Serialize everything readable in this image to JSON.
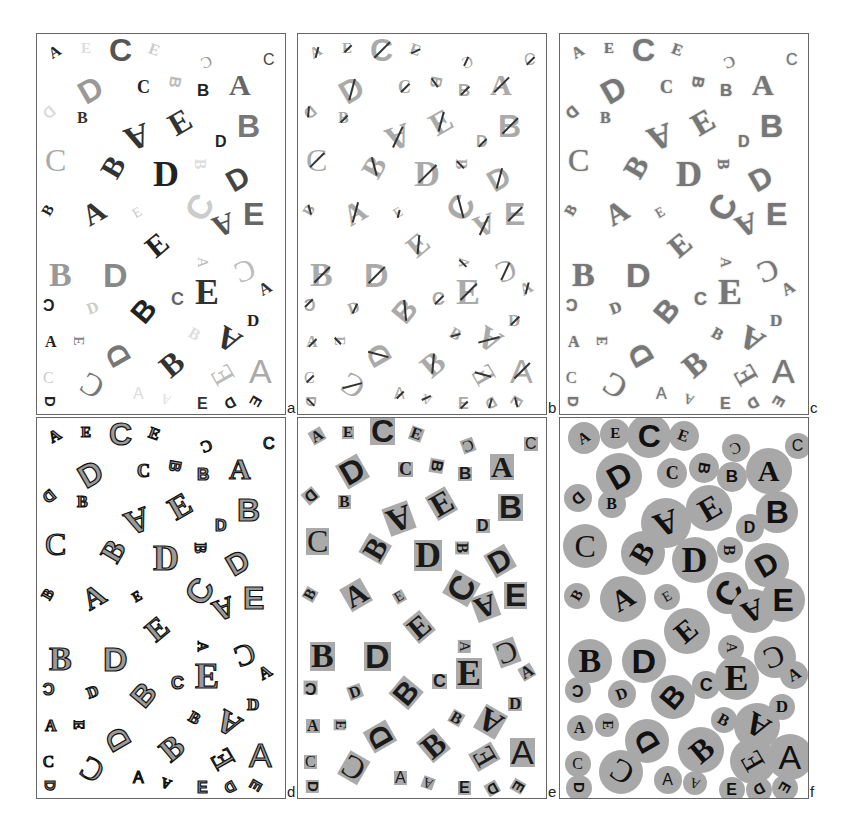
{
  "figure": {
    "panels": [
      {
        "id": "a",
        "label": "a",
        "style": "grayscale-mixed",
        "x": 36,
        "y": 33,
        "w": 250,
        "h": 382
      },
      {
        "id": "b",
        "label": "b",
        "style": "slashed-light",
        "x": 297,
        "y": 33,
        "w": 250,
        "h": 382
      },
      {
        "id": "c",
        "label": "c",
        "style": "outlined-blur",
        "x": 559,
        "y": 33,
        "w": 250,
        "h": 382
      },
      {
        "id": "d",
        "label": "d",
        "style": "filled-dark",
        "x": 36,
        "y": 417,
        "w": 250,
        "h": 382
      },
      {
        "id": "e",
        "label": "e",
        "style": "boxed-background",
        "x": 297,
        "y": 417,
        "w": 250,
        "h": 382
      },
      {
        "id": "f",
        "label": "f",
        "style": "circle-background",
        "x": 559,
        "y": 417,
        "w": 250,
        "h": 382
      }
    ],
    "letters": [
      {
        "c": "A",
        "x": 12,
        "y": 10,
        "s": 16,
        "r": -30,
        "f": "serif",
        "w": "bold",
        "g": "#222",
        "d": 32
      },
      {
        "c": "E",
        "x": 44,
        "y": 6,
        "s": 15,
        "r": 0,
        "f": "serif",
        "w": "bold",
        "g": "#ddd",
        "d": 30
      },
      {
        "c": "C",
        "x": 72,
        "y": 0,
        "s": 32,
        "r": 0,
        "f": "sans",
        "w": "bold",
        "g": "#555",
        "d": 44
      },
      {
        "c": "E",
        "x": 112,
        "y": 8,
        "s": 16,
        "r": 20,
        "f": "serif",
        "w": "bold",
        "g": "#ccc",
        "d": 30
      },
      {
        "c": "C",
        "x": 164,
        "y": 20,
        "s": 16,
        "r": 160,
        "f": "serif",
        "w": "normal",
        "g": "#999",
        "d": 28
      },
      {
        "c": "C",
        "x": 226,
        "y": 18,
        "s": 16,
        "r": 0,
        "f": "sans",
        "w": "normal",
        "g": "#444",
        "d": 26
      },
      {
        "c": "D",
        "x": 42,
        "y": 40,
        "s": 32,
        "r": -30,
        "f": "sans",
        "w": "bold",
        "g": "#999",
        "d": 46
      },
      {
        "c": "C",
        "x": 100,
        "y": 44,
        "s": 18,
        "r": 0,
        "f": "serif",
        "w": "bold",
        "g": "#222",
        "d": 30
      },
      {
        "c": "B",
        "x": 132,
        "y": 40,
        "s": 16,
        "r": 100,
        "f": "sans",
        "w": "bold",
        "g": "#bbb",
        "d": 30
      },
      {
        "c": "B",
        "x": 160,
        "y": 48,
        "s": 17,
        "r": 0,
        "f": "sans",
        "w": "bold",
        "g": "#222",
        "d": 30
      },
      {
        "c": "A",
        "x": 192,
        "y": 36,
        "s": 30,
        "r": 0,
        "f": "serif",
        "w": "bold",
        "g": "#666",
        "d": 46
      },
      {
        "c": "D",
        "x": 6,
        "y": 70,
        "s": 16,
        "r": 140,
        "f": "sans",
        "w": "bold",
        "g": "#ddd",
        "d": 28
      },
      {
        "c": "B",
        "x": 40,
        "y": 76,
        "s": 16,
        "r": 0,
        "f": "serif",
        "w": "bold",
        "g": "#333",
        "d": 28
      },
      {
        "c": "A",
        "x": 88,
        "y": 86,
        "s": 34,
        "r": 160,
        "f": "serif",
        "w": "bold",
        "g": "#333",
        "d": 50
      },
      {
        "c": "E",
        "x": 132,
        "y": 72,
        "s": 32,
        "r": -30,
        "f": "serif",
        "w": "bold",
        "g": "#333",
        "d": 46
      },
      {
        "c": "B",
        "x": 200,
        "y": 76,
        "s": 32,
        "r": 0,
        "f": "sans",
        "w": "bold",
        "g": "#777",
        "d": 42
      },
      {
        "c": "D",
        "x": 178,
        "y": 100,
        "s": 16,
        "r": 0,
        "f": "sans",
        "w": "bold",
        "g": "#222",
        "d": 28
      },
      {
        "c": "C",
        "x": 8,
        "y": 110,
        "s": 32,
        "r": 0,
        "f": "serif",
        "w": "normal",
        "g": "#aaa",
        "d": 44
      },
      {
        "c": "B",
        "x": 66,
        "y": 118,
        "s": 30,
        "r": -60,
        "f": "serif",
        "w": "bold",
        "g": "#333",
        "d": 44
      },
      {
        "c": "D",
        "x": 116,
        "y": 122,
        "s": 36,
        "r": 0,
        "f": "serif",
        "w": "bold",
        "g": "#222",
        "d": 46
      },
      {
        "c": "B",
        "x": 158,
        "y": 122,
        "s": 16,
        "r": 90,
        "f": "serif",
        "w": "bold",
        "g": "#ddd",
        "d": 26
      },
      {
        "c": "D",
        "x": 190,
        "y": 130,
        "s": 30,
        "r": -30,
        "f": "sans",
        "w": "bold",
        "g": "#444",
        "d": 44
      },
      {
        "c": "B",
        "x": 6,
        "y": 168,
        "s": 15,
        "r": -60,
        "f": "serif",
        "w": "bold",
        "g": "#222",
        "d": 26
      },
      {
        "c": "A",
        "x": 46,
        "y": 164,
        "s": 30,
        "r": -30,
        "f": "serif",
        "w": "bold",
        "g": "#333",
        "d": 46
      },
      {
        "c": "E",
        "x": 96,
        "y": 170,
        "s": 14,
        "r": -30,
        "f": "serif",
        "w": "normal",
        "g": "#ccc",
        "d": 26
      },
      {
        "c": "C",
        "x": 150,
        "y": 156,
        "s": 34,
        "r": -60,
        "f": "sans",
        "w": "bold",
        "g": "#ccc",
        "d": 42
      },
      {
        "c": "A",
        "x": 176,
        "y": 176,
        "s": 30,
        "r": 160,
        "f": "serif",
        "w": "bold",
        "g": "#555",
        "d": 44
      },
      {
        "c": "E",
        "x": 206,
        "y": 164,
        "s": 32,
        "r": 0,
        "f": "sans",
        "w": "bold",
        "g": "#666",
        "d": 44
      },
      {
        "c": "E",
        "x": 110,
        "y": 196,
        "s": 30,
        "r": -40,
        "f": "serif",
        "w": "bold",
        "g": "#222",
        "d": 46
      },
      {
        "c": "B",
        "x": 12,
        "y": 224,
        "s": 34,
        "r": 0,
        "f": "serif",
        "w": "bold",
        "g": "#999",
        "d": 44
      },
      {
        "c": "D",
        "x": 66,
        "y": 224,
        "s": 34,
        "r": 0,
        "f": "sans",
        "w": "bold",
        "g": "#888",
        "d": 44
      },
      {
        "c": "A",
        "x": 160,
        "y": 220,
        "s": 15,
        "r": 90,
        "f": "serif",
        "w": "normal",
        "g": "#bbb",
        "d": 26
      },
      {
        "c": "C",
        "x": 198,
        "y": 222,
        "s": 30,
        "r": 160,
        "f": "serif",
        "w": "normal",
        "g": "#bbb",
        "d": 42
      },
      {
        "c": "E",
        "x": 158,
        "y": 240,
        "s": 36,
        "r": 0,
        "f": "serif",
        "w": "bold",
        "g": "#333",
        "d": 44
      },
      {
        "c": "A",
        "x": 222,
        "y": 246,
        "s": 17,
        "r": -30,
        "f": "serif",
        "w": "bold",
        "g": "#333",
        "d": 28
      },
      {
        "c": "C",
        "x": 6,
        "y": 262,
        "s": 16,
        "r": 180,
        "f": "sans",
        "w": "bold",
        "g": "#222",
        "d": 26
      },
      {
        "c": "D",
        "x": 50,
        "y": 266,
        "s": 16,
        "r": -20,
        "f": "serif",
        "w": "bold",
        "g": "#ccc",
        "d": 28
      },
      {
        "c": "B",
        "x": 96,
        "y": 262,
        "s": 30,
        "r": -50,
        "f": "sans",
        "w": "bold",
        "g": "#222",
        "d": 44
      },
      {
        "c": "C",
        "x": 134,
        "y": 256,
        "s": 18,
        "r": 0,
        "f": "sans",
        "w": "bold",
        "g": "#666",
        "d": 28
      },
      {
        "c": "D",
        "x": 210,
        "y": 278,
        "s": 17,
        "r": 0,
        "f": "serif",
        "w": "bold",
        "g": "#222",
        "d": 26
      },
      {
        "c": "A",
        "x": 8,
        "y": 300,
        "s": 16,
        "r": 0,
        "f": "serif",
        "w": "bold",
        "g": "#222",
        "d": 26
      },
      {
        "c": "E",
        "x": 36,
        "y": 298,
        "s": 14,
        "r": 90,
        "f": "serif",
        "w": "bold",
        "g": "#888",
        "d": 24
      },
      {
        "c": "D",
        "x": 70,
        "y": 306,
        "s": 30,
        "r": -120,
        "f": "sans",
        "w": "bold",
        "g": "#777",
        "d": 44
      },
      {
        "c": "B",
        "x": 152,
        "y": 292,
        "s": 16,
        "r": 30,
        "f": "serif",
        "w": "bold",
        "g": "#ddd",
        "d": 26
      },
      {
        "c": "A",
        "x": 180,
        "y": 290,
        "s": 32,
        "r": -150,
        "f": "serif",
        "w": "bold",
        "g": "#333",
        "d": 46
      },
      {
        "c": "B",
        "x": 124,
        "y": 314,
        "s": 32,
        "r": -40,
        "f": "serif",
        "w": "bold",
        "g": "#333",
        "d": 46
      },
      {
        "c": "C",
        "x": 6,
        "y": 336,
        "s": 16,
        "r": 0,
        "f": "serif",
        "w": "normal",
        "g": "#ccc",
        "d": 26
      },
      {
        "c": "C",
        "x": 44,
        "y": 336,
        "s": 32,
        "r": -150,
        "f": "serif",
        "w": "normal",
        "g": "#777",
        "d": 44
      },
      {
        "c": "A",
        "x": 96,
        "y": 352,
        "s": 16,
        "r": 0,
        "f": "sans",
        "w": "normal",
        "g": "#ddd",
        "d": 28
      },
      {
        "c": "A",
        "x": 124,
        "y": 356,
        "s": 14,
        "r": 200,
        "f": "serif",
        "w": "normal",
        "g": "#ddd",
        "d": 24
      },
      {
        "c": "E",
        "x": 160,
        "y": 362,
        "s": 16,
        "r": 0,
        "f": "sans",
        "w": "bold",
        "g": "#333",
        "d": 26
      },
      {
        "c": "E",
        "x": 176,
        "y": 326,
        "s": 30,
        "r": -120,
        "f": "serif",
        "w": "normal",
        "g": "#bbb",
        "d": 46
      },
      {
        "c": "A",
        "x": 212,
        "y": 320,
        "s": 34,
        "r": 0,
        "f": "sans",
        "w": "normal",
        "g": "#aaa",
        "d": 46
      },
      {
        "c": "D",
        "x": 8,
        "y": 360,
        "s": 15,
        "r": 90,
        "f": "sans",
        "w": "bold",
        "g": "#222",
        "d": 26
      },
      {
        "c": "D",
        "x": 188,
        "y": 362,
        "s": 15,
        "r": 150,
        "f": "sans",
        "w": "bold",
        "g": "#222",
        "d": 26
      },
      {
        "c": "E",
        "x": 214,
        "y": 360,
        "s": 15,
        "r": 120,
        "f": "sans",
        "w": "bold",
        "g": "#222",
        "d": 26
      }
    ]
  }
}
